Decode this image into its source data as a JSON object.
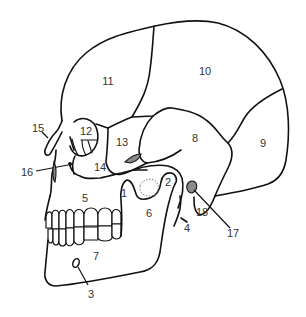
{
  "diagram": {
    "type": "anatomical-illustration",
    "line_color": "#111111",
    "label_color": "#333333",
    "background": "#ffffff",
    "labels": [
      {
        "id": "1",
        "text": "1",
        "x": 124,
        "y": 193
      },
      {
        "id": "2",
        "text": "2",
        "x": 168,
        "y": 182
      },
      {
        "id": "3",
        "text": "3",
        "x": 91,
        "y": 294
      },
      {
        "id": "4",
        "text": "4",
        "x": 187,
        "y": 228
      },
      {
        "id": "5",
        "text": "5",
        "x": 85,
        "y": 198
      },
      {
        "id": "6",
        "text": "6",
        "x": 149,
        "y": 213
      },
      {
        "id": "7",
        "text": "7",
        "x": 96,
        "y": 256
      },
      {
        "id": "8",
        "text": "8",
        "x": 195,
        "y": 138
      },
      {
        "id": "9",
        "text": "9",
        "x": 263,
        "y": 143
      },
      {
        "id": "10",
        "text": "10",
        "x": 205,
        "y": 71
      },
      {
        "id": "11",
        "text": "11",
        "x": 108,
        "y": 81
      },
      {
        "id": "12",
        "text": "12",
        "x": 86,
        "y": 131
      },
      {
        "id": "13",
        "text": "13",
        "x": 122,
        "y": 142
      },
      {
        "id": "14",
        "text": "14",
        "x": 100,
        "y": 167
      },
      {
        "id": "15",
        "text": "15",
        "x": 38,
        "y": 128
      },
      {
        "id": "16",
        "text": "16",
        "x": 27,
        "y": 172
      },
      {
        "id": "17",
        "text": "17",
        "x": 233,
        "y": 233
      },
      {
        "id": "18",
        "text": "18",
        "x": 202,
        "y": 212
      }
    ]
  }
}
